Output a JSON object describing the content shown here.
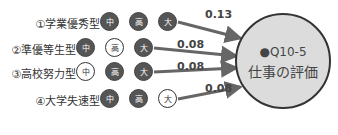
{
  "colors": {
    "dark_node": "#555555",
    "light_node": "#ffffff",
    "arrow": "#666666",
    "target_fill": "#dcdcdc"
  },
  "target": {
    "id": "●Q10-5",
    "label": "仕事の評価"
  },
  "rows": [
    {
      "label": "①学業優秀型",
      "nodes": [
        {
          "text": "中",
          "style": "dark"
        },
        {
          "text": "高",
          "style": "dark"
        },
        {
          "text": "大",
          "style": "dark"
        }
      ],
      "coef": "0.13"
    },
    {
      "label": "②準優等生型",
      "nodes": [
        {
          "text": "中",
          "style": "dark"
        },
        {
          "text": "高",
          "style": "light"
        },
        {
          "text": "大",
          "style": "dark"
        }
      ],
      "coef": "0.08"
    },
    {
      "label": "③高校努力型",
      "nodes": [
        {
          "text": "中",
          "style": "light"
        },
        {
          "text": "高",
          "style": "dark"
        },
        {
          "text": "大",
          "style": "dark"
        }
      ],
      "coef": "0.08"
    },
    {
      "label": "④大学失速型",
      "nodes": [
        {
          "text": "中",
          "style": "dark"
        },
        {
          "text": "高",
          "style": "dark"
        },
        {
          "text": "大",
          "style": "light"
        }
      ],
      "coef": "0.08"
    }
  ]
}
